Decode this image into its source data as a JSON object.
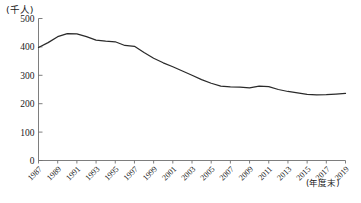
{
  "chart_data": {
    "type": "line",
    "title": "",
    "subtitle": "",
    "ylabel": "(千人)",
    "xlabel": "(年度末)",
    "ylim": [
      0,
      500
    ],
    "yticks": [
      0,
      100,
      200,
      300,
      400,
      500
    ],
    "ytick_labels": [
      "0",
      "100",
      "200",
      "300",
      "400",
      "500"
    ],
    "grid": false,
    "legend": null,
    "xtick_labels": [
      "1987",
      "1989",
      "1991",
      "1993",
      "1995",
      "1997",
      "1999",
      "2001",
      "2003",
      "2005",
      "2007",
      "2009",
      "2011",
      "2013",
      "2015",
      "2017",
      "2019"
    ],
    "x": [
      1987,
      1988,
      1989,
      1990,
      1991,
      1992,
      1993,
      1994,
      1995,
      1996,
      1997,
      1998,
      1999,
      2000,
      2001,
      2002,
      2003,
      2004,
      2005,
      2006,
      2007,
      2008,
      2009,
      2010,
      2011,
      2012,
      2013,
      2014,
      2015,
      2016,
      2017,
      2018,
      2019
    ],
    "values": [
      398,
      415,
      436,
      447,
      446,
      436,
      424,
      420,
      418,
      405,
      402,
      380,
      360,
      344,
      330,
      315,
      300,
      285,
      272,
      262,
      259,
      258,
      256,
      262,
      260,
      250,
      243,
      238,
      233,
      231,
      232,
      234,
      236
    ],
    "series": [
      {
        "name": "",
        "values": [
          398,
          415,
          436,
          447,
          446,
          436,
          424,
          420,
          418,
          405,
          402,
          380,
          360,
          344,
          330,
          315,
          300,
          285,
          272,
          262,
          259,
          258,
          256,
          262,
          260,
          250,
          243,
          238,
          233,
          231,
          232,
          234,
          236
        ]
      }
    ],
    "line_color": "#2a2a2a",
    "axis_color": "#6f6f6f"
  }
}
